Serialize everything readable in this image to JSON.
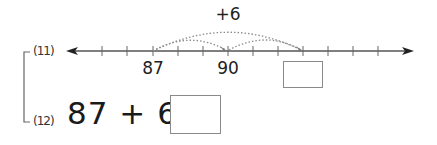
{
  "problems": [
    {
      "label": "(11)",
      "type": "number-line",
      "jump_label": "+6",
      "tick_labels": [
        {
          "value": "87",
          "x": 153
        },
        {
          "value": "90",
          "x": 228
        }
      ],
      "answer": ""
    },
    {
      "label": "(12)",
      "type": "equation",
      "expression": "87 + 6 =",
      "answer": ""
    }
  ],
  "number_line": {
    "start_tick": 87,
    "step": 1,
    "jumps": [
      "87→90",
      "90→93",
      "87→93"
    ]
  },
  "colors": {
    "line": "#555555",
    "arc": "#8c8c8c",
    "box_border": "#8a8a8a"
  }
}
